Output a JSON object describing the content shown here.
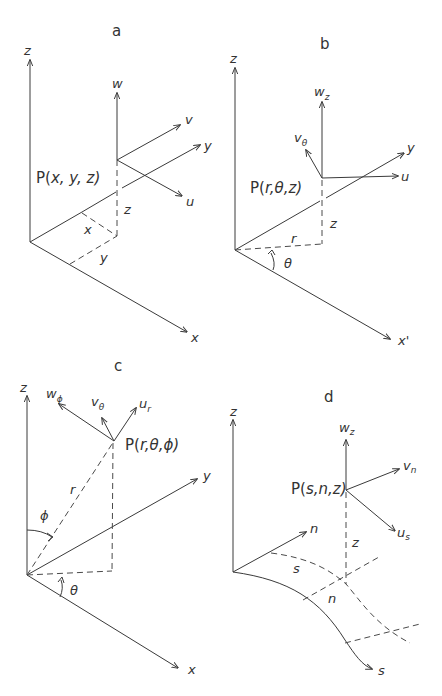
{
  "figure": {
    "panels": [
      {
        "id": "a",
        "title": "a",
        "system": "cartesian",
        "point_label_prefix": "P(",
        "point_label_vars": "x, y, z",
        "point_label_suffix": ")",
        "axes": {
          "z": "z",
          "x": "x",
          "y": "y"
        },
        "vectors": {
          "w": "w",
          "v": "v",
          "u": "u"
        },
        "coord_labels": {
          "x": "x",
          "y": "y",
          "z": "z"
        }
      },
      {
        "id": "b",
        "title": "b",
        "system": "cylindrical",
        "point_label_prefix": "P(",
        "point_label_vars": "r,θ,z",
        "point_label_suffix": ")",
        "axes": {
          "z": "z",
          "x": "x'",
          "y": "y"
        },
        "vectors": {
          "w": "w",
          "w_sub": "z",
          "v": "v",
          "v_sub": "θ",
          "u": "u"
        },
        "coord_labels": {
          "r": "r",
          "theta": "θ",
          "z": "z"
        }
      },
      {
        "id": "c",
        "title": "c",
        "system": "spherical",
        "point_label_prefix": "P(",
        "point_label_vars": "r,θ,ϕ",
        "point_label_suffix": ")",
        "axes": {
          "z": "z",
          "x": "x",
          "y": "y"
        },
        "vectors": {
          "w": "w",
          "w_sub": "ϕ",
          "v": "v",
          "v_sub": "θ",
          "u": "u",
          "u_sub": "r"
        },
        "coord_labels": {
          "r": "r",
          "phi": "ϕ",
          "theta": "θ"
        }
      },
      {
        "id": "d",
        "title": "d",
        "system": "curvilinear",
        "point_label_prefix": "P(",
        "point_label_vars": "s,n,z",
        "point_label_suffix": ")",
        "axes": {
          "z": "z",
          "n": "n",
          "s": "s"
        },
        "vectors": {
          "w": "w",
          "w_sub": "z",
          "v": "v",
          "v_sub": "n",
          "u": "u",
          "u_sub": "s"
        },
        "coord_labels": {
          "s": "s",
          "n": "n",
          "z": "z"
        }
      }
    ]
  }
}
